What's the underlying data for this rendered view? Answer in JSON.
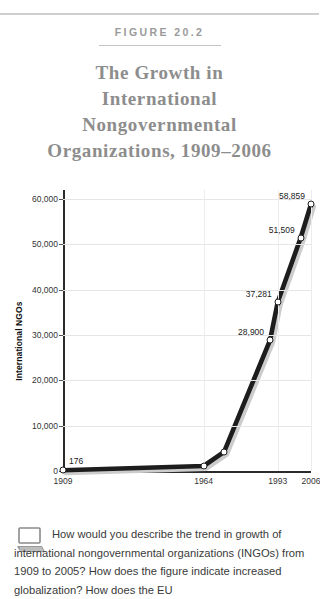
{
  "figure": {
    "label": "FIGURE 20.2",
    "title_lines": [
      "The Growth in",
      "International",
      "Nongovernmental",
      "Organizations, 1909–2006"
    ],
    "title_color": "#8d8d8d",
    "label_color": "#9a9a9a"
  },
  "caption": {
    "icon": "computer-icon",
    "text": "How would you describe the trend in growth of international nongovernmental organizations (INGOs) from 1909 to 2005? How does the figure indicate increased globalization? How does the EU"
  },
  "chart_data": {
    "type": "line",
    "title": "The Growth in International Nongovernmental Organizations, 1909–2006",
    "xlabel": "",
    "ylabel": "International NGOs",
    "ylim": [
      0,
      62000
    ],
    "xlim": [
      1909,
      2006
    ],
    "grid": true,
    "legend": "none",
    "line_color": "#1d1d1d",
    "marker_face": "#ffffff",
    "y_ticks": [
      {
        "value": 0,
        "label": "0"
      },
      {
        "value": 10000,
        "label": "10,000"
      },
      {
        "value": 20000,
        "label": "20,000"
      },
      {
        "value": 30000,
        "label": "30,000"
      },
      {
        "value": 40000,
        "label": "40,000"
      },
      {
        "value": 50000,
        "label": "50,000"
      },
      {
        "value": 60000,
        "label": "60,000"
      }
    ],
    "x_ticks": [
      {
        "value": 1909,
        "label": "1909"
      },
      {
        "value": 1964,
        "label": "1964"
      },
      {
        "value": 1993,
        "label": "1993"
      },
      {
        "value": 2006,
        "label": "2006"
      }
    ],
    "x": [
      1909,
      1964,
      1972,
      1990,
      1993,
      2002,
      2006
    ],
    "values": [
      176,
      1100,
      4200,
      28900,
      37281,
      51509,
      58859
    ],
    "point_labels": [
      {
        "x": 1909,
        "y": 176,
        "label": "176",
        "side": "right"
      },
      {
        "x": 1990,
        "y": 28900,
        "label": "28,900",
        "side": "left"
      },
      {
        "x": 1993,
        "y": 37281,
        "label": "37,281",
        "side": "left"
      },
      {
        "x": 2002,
        "y": 51509,
        "label": "51,509",
        "side": "left"
      },
      {
        "x": 2006,
        "y": 58859,
        "label": "58,859",
        "side": "left"
      }
    ]
  }
}
